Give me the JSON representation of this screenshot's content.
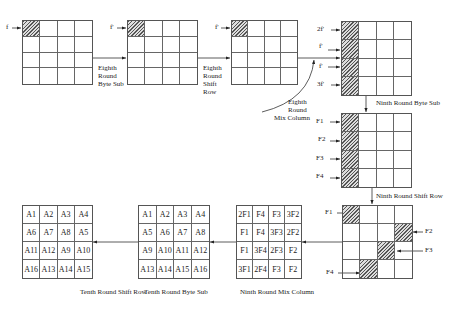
{
  "diagram": {
    "labels": {
      "eighth_byte_sub": [
        "Eighth",
        "Round",
        "Byte Sub"
      ],
      "eighth_shift_row": [
        "Eighth",
        "Round",
        "Shift",
        "Row"
      ],
      "eighth_mix_column": [
        "Eighth",
        "Round",
        "Mix Column"
      ],
      "ninth_byte_sub": "Ninth Round Byte Sub",
      "ninth_shift_row": "Ninth Round Shift Row",
      "ninth_mix_column": "Ninth Round Mix Column",
      "tenth_byte_sub": "Tenth Round Byte Sub",
      "tenth_shift_row": "Tenth Round Shift Row"
    },
    "fault_inputs": {
      "grid1": "f",
      "grid2": "f'",
      "grid3": "f'",
      "grid4": [
        "2f'",
        "f'",
        "f'",
        "3f'"
      ],
      "grid5": [
        "F1",
        "F2",
        "F3",
        "F4"
      ],
      "grid6": [
        "F1",
        "F2",
        "F3",
        "F4"
      ]
    },
    "mix_column_grid": [
      [
        "2F1",
        "F4",
        "F3",
        "3F2"
      ],
      [
        "F1",
        "F4",
        "3F3",
        "2F2"
      ],
      [
        "F1",
        "3F4",
        "2F3",
        "F2"
      ],
      [
        "3F1",
        "2F4",
        "F3",
        "F2"
      ]
    ],
    "tenth_byte_sub_grid": [
      [
        "A1",
        "A2",
        "A3",
        "A4"
      ],
      [
        "A5",
        "A6",
        "A7",
        "A8"
      ],
      [
        "A9",
        "A10",
        "A11",
        "A12"
      ],
      [
        "A13",
        "A14",
        "A15",
        "A16"
      ]
    ],
    "tenth_shift_row_grid": [
      [
        "A1",
        "A2",
        "A3",
        "A4"
      ],
      [
        "A6",
        "A7",
        "A8",
        "A5"
      ],
      [
        "A11",
        "A12",
        "A9",
        "A10"
      ],
      [
        "A16",
        "A13",
        "A14",
        "A15"
      ]
    ]
  }
}
